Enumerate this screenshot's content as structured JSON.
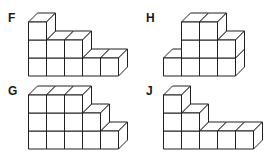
{
  "page": {
    "background_color": "#ffffff",
    "line_color": "#231f20",
    "face_color": "#ffffff",
    "label_color": "#1a1a1a",
    "width": 268,
    "height": 157
  },
  "figures": [
    {
      "id": "figure-f",
      "label": "F",
      "label_x": 8,
      "label_y": 12,
      "origin_x": 28,
      "origin_y": 12,
      "cube": 18,
      "depth_x": 9,
      "depth_y": 9,
      "description": "stepped stack of unit cubes, one row deep",
      "columns": [
        3,
        2,
        2,
        1,
        1
      ],
      "cube_count": 9
    },
    {
      "id": "figure-h",
      "label": "H",
      "label_x": 146,
      "label_y": 12,
      "origin_x": 163,
      "origin_y": 12,
      "cube": 18,
      "depth_x": 9,
      "depth_y": 9,
      "description": "stepped stack of unit cubes, one row deep",
      "columns": [
        1,
        3,
        3,
        2
      ],
      "cube_count": 9
    },
    {
      "id": "figure-g",
      "label": "G",
      "label_x": 8,
      "label_y": 85,
      "origin_x": 28,
      "origin_y": 85,
      "cube": 18,
      "depth_x": 9,
      "depth_y": 9,
      "description": "stepped stack of unit cubes, one row deep",
      "columns": [
        3,
        3,
        3,
        2,
        1
      ],
      "cube_count": 12
    },
    {
      "id": "figure-j",
      "label": "J",
      "label_x": 146,
      "label_y": 85,
      "origin_x": 163,
      "origin_y": 85,
      "cube": 18,
      "depth_x": 9,
      "depth_y": 9,
      "description": "stepped stack of unit cubes, one row deep",
      "columns": [
        3,
        2,
        1,
        1,
        1
      ],
      "cube_count": 8
    }
  ]
}
